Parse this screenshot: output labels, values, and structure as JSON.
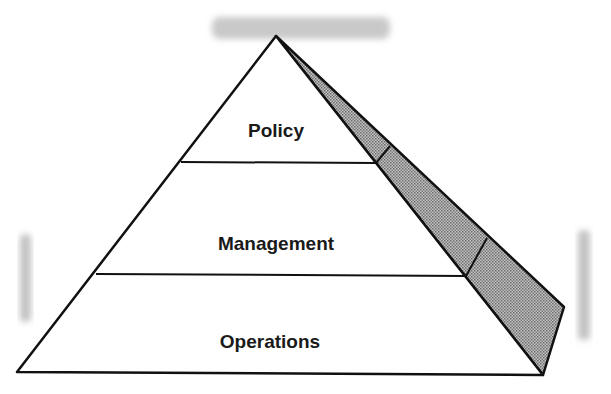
{
  "diagram": {
    "type": "pyramid",
    "levels": [
      {
        "label": "Policy",
        "position": "top"
      },
      {
        "label": "Management",
        "position": "middle"
      },
      {
        "label": "Operations",
        "position": "bottom"
      }
    ],
    "side_face": {
      "fill": "dotted-grey",
      "segments": 3
    },
    "colors": {
      "line": "#111111",
      "shade": "#9a9a9a",
      "smudge": "#c8c8c8",
      "background": "#ffffff"
    }
  }
}
